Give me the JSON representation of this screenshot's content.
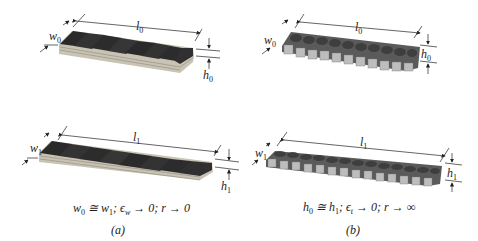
{
  "figure": {
    "panels": [
      {
        "id": "a",
        "panel_label": "(a)",
        "top_block": {
          "length_label": "l",
          "length_sub": "0",
          "width_label": "w",
          "width_sub": "0",
          "height_label": "h",
          "height_sub": "0"
        },
        "bottom_block": {
          "length_label": "l",
          "length_sub": "1",
          "width_label": "w",
          "width_sub": "1",
          "height_label": "h",
          "height_sub": "1"
        },
        "condition": "w₀ ≅ w₁; ϵ_w → 0; r → 0",
        "condition_parts": {
          "p1": "w",
          "s1": "0",
          "p2": " ≅ w",
          "s2": "1",
          "p3": "; ϵ",
          "s3": "w",
          "p4": " → 0; r → 0"
        }
      },
      {
        "id": "b",
        "panel_label": "(b)",
        "top_block": {
          "length_label": "l",
          "length_sub": "0",
          "width_label": "w",
          "width_sub": "0",
          "height_label": "h",
          "height_sub": "0"
        },
        "bottom_block": {
          "length_label": "l",
          "length_sub": "1",
          "width_label": "w",
          "width_sub": "1",
          "height_label": "h",
          "height_sub": "1"
        },
        "condition": "h₀ ≅ h₁; ϵ_t → 0; r → ∞",
        "condition_parts": {
          "p1": "h",
          "s1": "0",
          "p2": " ≅ h",
          "s2": "1",
          "p3": "; ϵ",
          "s3": "t",
          "p4": " → 0; r → ∞"
        }
      }
    ],
    "colors": {
      "block_top": "#2b2b2b",
      "block_side": "#c8c4b8",
      "hex_top": "#4a4a4a",
      "hex_side": "#b9b9b9",
      "line": "#222222"
    }
  }
}
